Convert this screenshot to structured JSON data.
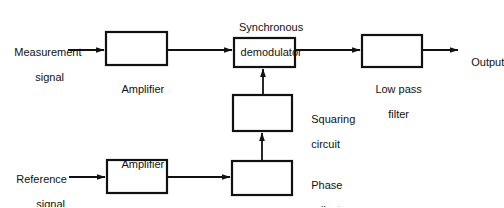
{
  "diagram": {
    "type": "block-diagram",
    "canvas": {
      "width": 504,
      "height": 207
    },
    "style": {
      "background": "#ffffff",
      "line_color": "#111111",
      "text_color": "#111111",
      "box_fill": "#ffffff",
      "box_stroke_width": 2
    },
    "blocks": [
      {
        "id": "amplifier-top",
        "label": "Amplifier",
        "label_position": "below",
        "x": 106,
        "y": 32,
        "w": 61,
        "h": 33
      },
      {
        "id": "synchronous-demodulator",
        "label": "Synchronous\ndemodulator",
        "label_line1": "Synchronous",
        "label_line2": "demodulator",
        "label_position": "above",
        "x": 234,
        "y": 38,
        "w": 61,
        "h": 29
      },
      {
        "id": "low-pass-filter",
        "label": "Low pass\nfilter",
        "label_line1": "Low pass",
        "label_line2": "filter",
        "label_position": "below",
        "x": 362,
        "y": 35,
        "w": 60,
        "h": 32
      },
      {
        "id": "squaring-circuit",
        "label": "Squaring\ncircuit",
        "label_line1": "Squaring",
        "label_line2": "circuit",
        "label_position": "right",
        "x": 233,
        "y": 95,
        "w": 59,
        "h": 36
      },
      {
        "id": "amplifier-bottom",
        "label": "Amplifier",
        "label_position": "above",
        "x": 107,
        "y": 160,
        "w": 60,
        "h": 33
      },
      {
        "id": "phase-adjuster",
        "label": "Phase\nadjuster",
        "label_line1": "Phase",
        "label_line2": "adjuster",
        "label_position": "right",
        "x": 232,
        "y": 161,
        "w": 60,
        "h": 34
      }
    ],
    "io_labels": [
      {
        "id": "measurement-signal",
        "line1": "Measurement",
        "line2": "signal",
        "kind": "input"
      },
      {
        "id": "reference-signal",
        "line1": "Reference",
        "line2": "signal",
        "kind": "input"
      },
      {
        "id": "output",
        "line1": "Output",
        "kind": "output"
      }
    ],
    "connections": [
      {
        "id": "measurement-to-amplifier",
        "from": "measurement-signal",
        "to": "amplifier-top",
        "orientation": "horizontal",
        "arrow": true
      },
      {
        "id": "amplifier-to-demodulator",
        "from": "amplifier-top",
        "to": "synchronous-demodulator",
        "orientation": "horizontal",
        "arrow": true
      },
      {
        "id": "demodulator-to-filter",
        "from": "synchronous-demodulator",
        "to": "low-pass-filter",
        "orientation": "horizontal",
        "arrow": true
      },
      {
        "id": "filter-to-output",
        "from": "low-pass-filter",
        "to": "output",
        "orientation": "horizontal",
        "arrow": true
      },
      {
        "id": "reference-to-amplifier",
        "from": "reference-signal",
        "to": "amplifier-bottom",
        "orientation": "horizontal",
        "arrow": true
      },
      {
        "id": "amplifier-to-phase-adjuster",
        "from": "amplifier-bottom",
        "to": "phase-adjuster",
        "orientation": "horizontal",
        "arrow": true
      },
      {
        "id": "phase-adjuster-to-squaring",
        "from": "phase-adjuster",
        "to": "squaring-circuit",
        "orientation": "vertical-up",
        "arrow": true
      },
      {
        "id": "squaring-to-demodulator",
        "from": "squaring-circuit",
        "to": "synchronous-demodulator",
        "orientation": "vertical-up",
        "arrow": true
      }
    ]
  }
}
